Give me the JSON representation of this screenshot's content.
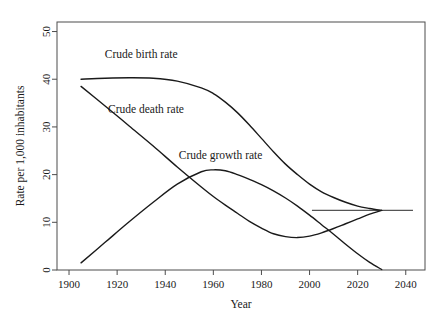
{
  "chart_data": {
    "type": "line",
    "title": "",
    "xlabel": "Year",
    "ylabel": "Rate per 1,000 inhabitants",
    "xlim": [
      1895,
      2048
    ],
    "ylim": [
      0,
      52
    ],
    "xticks": [
      "1900",
      "1920",
      "1940",
      "1960",
      "1980",
      "2000",
      "2020",
      "2040"
    ],
    "xtick_values": [
      1900,
      1920,
      1940,
      1960,
      1980,
      2000,
      2020,
      2040
    ],
    "yticks": [
      "0",
      "10",
      "20",
      "30",
      "40",
      "50"
    ],
    "ytick_values": [
      0,
      10,
      20,
      30,
      40,
      50
    ],
    "grid": false,
    "legend_position": "inline-annotations",
    "series": [
      {
        "name": "Crude birth rate",
        "label": "Crude birth rate",
        "label_x": 1930,
        "label_y": 44.5,
        "x": [
          1905,
          1915,
          1925,
          1935,
          1945,
          1955,
          1960,
          1965,
          1970,
          1975,
          1980,
          1985,
          1990,
          1995,
          2000,
          2005,
          2010,
          2015,
          2020,
          2025,
          2030
        ],
        "values": [
          40.0,
          40.2,
          40.3,
          40.2,
          39.6,
          38.2,
          37.0,
          35.2,
          33.0,
          30.4,
          27.6,
          24.8,
          22.2,
          20.0,
          18.0,
          16.4,
          15.2,
          14.2,
          13.4,
          12.9,
          12.5
        ]
      },
      {
        "name": "Crude death rate",
        "label": "Crude death rate",
        "label_x": 1932,
        "label_y": 33.0,
        "x": [
          1905,
          1915,
          1925,
          1935,
          1945,
          1955,
          1960,
          1965,
          1970,
          1975,
          1980,
          1985,
          1990,
          1995,
          2000,
          2005,
          2010,
          2015,
          2020,
          2025,
          2030
        ],
        "values": [
          38.5,
          34.4,
          30.2,
          26.0,
          21.6,
          17.4,
          15.4,
          13.6,
          11.9,
          10.2,
          8.8,
          7.6,
          7.0,
          6.8,
          7.1,
          7.8,
          8.7,
          9.7,
          10.7,
          11.7,
          12.5
        ]
      },
      {
        "name": "Crude growth rate",
        "label": "Crude growth rate",
        "label_x": 1963,
        "label_y": 23.2,
        "x": [
          1905,
          1915,
          1925,
          1935,
          1945,
          1955,
          1960,
          1965,
          1970,
          1975,
          1980,
          1985,
          1990,
          1995,
          2000,
          2005,
          2010,
          2015,
          2020,
          2025,
          2030
        ],
        "values": [
          1.5,
          5.8,
          10.1,
          14.2,
          18.0,
          20.6,
          21.0,
          20.8,
          20.0,
          19.0,
          17.9,
          16.6,
          15.1,
          13.4,
          11.5,
          9.5,
          7.5,
          5.4,
          3.4,
          1.6,
          0.1
        ]
      }
    ],
    "annotations": [
      {
        "name": "convergence-reference-line",
        "type": "horizontal-segment",
        "y": 12.5,
        "x_start": 2001,
        "x_end": 2043
      }
    ]
  }
}
